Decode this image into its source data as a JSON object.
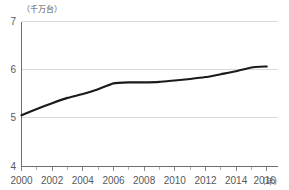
{
  "chart_data": {
    "type": "line",
    "title": "",
    "subtitle": "",
    "xlabel": "(年)",
    "ylabel": "（千万台）",
    "unit_label": "（千万台）",
    "x_suffix_label": "(年)",
    "xlim": [
      2000,
      2016
    ],
    "ylim": [
      4,
      7
    ],
    "y_ticks": [
      "4",
      "5",
      "6",
      "7"
    ],
    "y_tick_values": [
      4,
      5,
      6,
      7
    ],
    "x_ticks": [
      "2000",
      "2002",
      "2004",
      "2006",
      "2008",
      "2010",
      "2012",
      "2014",
      "2016"
    ],
    "x_tick_values": [
      2000,
      2002,
      2004,
      2006,
      2008,
      2010,
      2012,
      2014,
      2016
    ],
    "x_minor_step": 1,
    "grid": "horizontal",
    "legend": "none",
    "series": [
      {
        "name": "保有台数",
        "color": "#1a1a1a",
        "x": [
          2000,
          2001,
          2002,
          2003,
          2004,
          2005,
          2006,
          2007,
          2008,
          2009,
          2010,
          2011,
          2012,
          2013,
          2014,
          2015,
          2016
        ],
        "values": [
          5.06,
          5.19,
          5.31,
          5.42,
          5.5,
          5.6,
          5.72,
          5.74,
          5.74,
          5.75,
          5.78,
          5.81,
          5.85,
          5.91,
          5.97,
          6.05,
          6.07
        ]
      }
    ],
    "annotations": []
  },
  "axes": {
    "y_unit": "（千万台）",
    "x_unit": "(年)"
  }
}
